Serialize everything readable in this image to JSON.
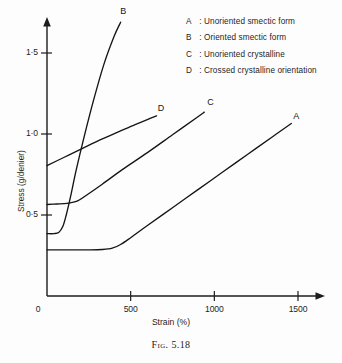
{
  "figure": {
    "caption": "Fig. 5.18"
  },
  "chart_data": {
    "type": "line",
    "title": "",
    "xlabel": "Strain (%)",
    "ylabel": "Stress (g/denier)",
    "xlim": [
      0,
      1650
    ],
    "ylim": [
      0,
      1.72
    ],
    "grid": false,
    "legend_position": "top-right",
    "xticks": [
      0,
      500,
      1000,
      1500
    ],
    "xtick_labels": [
      "0",
      "500",
      "1000",
      "1500"
    ],
    "yticks": [
      0.5,
      1.0,
      1.5
    ],
    "ytick_labels": [
      "0·5",
      "1·0",
      "1·5"
    ],
    "y_origin_label": "0",
    "legend": [
      {
        "key": "A",
        "sep": ":",
        "text": "Unoriented smectic form"
      },
      {
        "key": "B",
        "sep": ":",
        "text": "Oriented smectic form"
      },
      {
        "key": "C",
        "sep": ":",
        "text": "Unoriented crystalline"
      },
      {
        "key": "D",
        "sep": ":",
        "text": "Crossed crystalline orientation"
      }
    ],
    "series": [
      {
        "name": "A",
        "label": "A",
        "description": "Unoriented smectic form",
        "points": [
          [
            0,
            0.285
          ],
          [
            120,
            0.285
          ],
          [
            250,
            0.285
          ],
          [
            330,
            0.287
          ],
          [
            390,
            0.295
          ],
          [
            440,
            0.318
          ],
          [
            500,
            0.36
          ],
          [
            600,
            0.435
          ],
          [
            750,
            0.545
          ],
          [
            900,
            0.655
          ],
          [
            1050,
            0.765
          ],
          [
            1200,
            0.875
          ],
          [
            1350,
            0.985
          ],
          [
            1460,
            1.065
          ]
        ]
      },
      {
        "name": "B",
        "label": "B",
        "description": "Oriented smectic form",
        "points": [
          [
            0,
            0.385
          ],
          [
            40,
            0.385
          ],
          [
            70,
            0.392
          ],
          [
            95,
            0.43
          ],
          [
            115,
            0.5
          ],
          [
            140,
            0.61
          ],
          [
            175,
            0.78
          ],
          [
            220,
            0.975
          ],
          [
            280,
            1.215
          ],
          [
            340,
            1.43
          ],
          [
            400,
            1.6
          ],
          [
            440,
            1.69
          ]
        ]
      },
      {
        "name": "C",
        "label": "C",
        "description": "Unoriented crystalline",
        "points": [
          [
            0,
            0.565
          ],
          [
            60,
            0.568
          ],
          [
            120,
            0.572
          ],
          [
            180,
            0.585
          ],
          [
            240,
            0.625
          ],
          [
            330,
            0.69
          ],
          [
            450,
            0.78
          ],
          [
            600,
            0.885
          ],
          [
            750,
            0.995
          ],
          [
            900,
            1.105
          ],
          [
            940,
            1.135
          ]
        ]
      },
      {
        "name": "D",
        "label": "D",
        "description": "Crossed crystalline orientation",
        "points": [
          [
            0,
            0.805
          ],
          [
            100,
            0.855
          ],
          [
            200,
            0.905
          ],
          [
            320,
            0.965
          ],
          [
            430,
            1.015
          ],
          [
            530,
            1.06
          ],
          [
            620,
            1.098
          ],
          [
            655,
            1.112
          ]
        ]
      }
    ],
    "curve_label_positions": {
      "A": [
        1490,
        1.105
      ],
      "B": [
        455,
        1.755
      ],
      "C": [
        975,
        1.19
      ],
      "D": [
        680,
        1.155
      ]
    }
  }
}
